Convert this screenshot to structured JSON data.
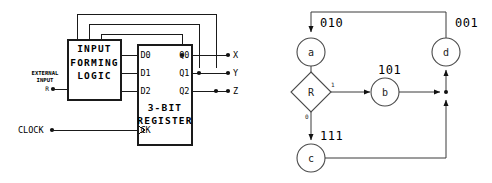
{
  "figure": {
    "panels": [
      "circuit-schematic",
      "state-transition-diagram"
    ]
  },
  "circuit": {
    "logic_block": {
      "line1": "INPUT",
      "line2": "FORMING",
      "line3": "LOGIC"
    },
    "register_block": {
      "line1": "3-BIT",
      "line2": "REGISTER"
    },
    "register_inputs": [
      "D0",
      "D1",
      "D2"
    ],
    "register_outputs": [
      "Q0",
      "Q1",
      "Q2"
    ],
    "clock_pin": "CK",
    "signals": {
      "external_input_line1": "EXTERNAL",
      "external_input_line2": "INPUT",
      "external_input_name": "R",
      "clock_name": "CLOCK"
    },
    "outputs": [
      "X",
      "Y",
      "Z"
    ]
  },
  "state_diagram": {
    "type": "state-transition",
    "nodes": [
      {
        "id": "a",
        "label": "a",
        "code": "010"
      },
      {
        "id": "b",
        "label": "b",
        "code": "101"
      },
      {
        "id": "c",
        "label": "c",
        "code": "111"
      },
      {
        "id": "d",
        "label": "d",
        "code": "001"
      }
    ],
    "decision": {
      "id": "R",
      "label": "R",
      "branch_true": "1",
      "branch_false": "0"
    },
    "edges": [
      {
        "from": "a",
        "to": "R"
      },
      {
        "from": "R",
        "to": "b",
        "condition": "1"
      },
      {
        "from": "R",
        "to": "c",
        "condition": "0"
      },
      {
        "from": "b",
        "to": "d"
      },
      {
        "from": "c",
        "to": "d"
      },
      {
        "from": "d",
        "to": "a"
      }
    ]
  },
  "colors": {
    "ink": "#111111",
    "wire": "#1a1a1a",
    "node_stroke": "#4a4a4a",
    "background": "#ffffff"
  }
}
